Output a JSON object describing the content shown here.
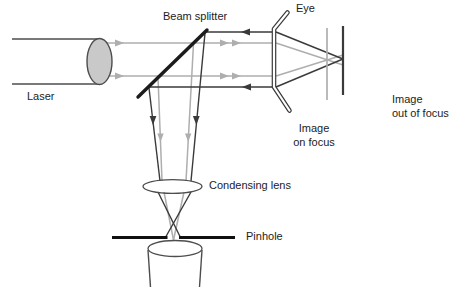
{
  "colors": {
    "bg": "#ffffff",
    "ray_gray": "#aeaeae",
    "ray_dark": "#3a3a3a",
    "outline": "#4d4d4d",
    "splitter": "#1c1c1c",
    "pinhole": "#101010",
    "leader": "#555555",
    "text": "#1c1c1c",
    "fill_light": "#c9c9c9",
    "fill_lighter": "#d9d9d9"
  },
  "labels": {
    "beam_splitter": "Beam splitter",
    "eye": "Eye",
    "laser": "Laser",
    "condensing_lens": "Condensing lens",
    "pinhole": "Pinhole",
    "image_on_focus": {
      "line1": "Image",
      "line2": "on focus"
    },
    "image_out_of_focus": {
      "line1": "Image",
      "line2": "out of focus"
    }
  }
}
